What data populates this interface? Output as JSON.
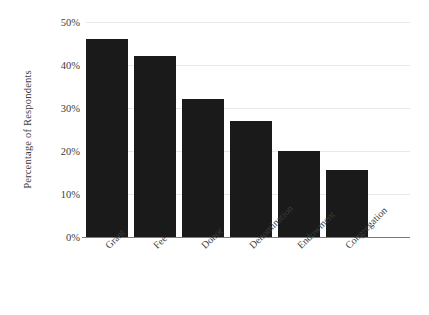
{
  "chart_data": {
    "type": "bar",
    "title": "",
    "xlabel": "",
    "ylabel": "Percentage of Respondents",
    "categories": [
      "Grant",
      "Fee",
      "Donor",
      "Denomination",
      "Endowment",
      "Congregation"
    ],
    "values": [
      46,
      42,
      32,
      27,
      20,
      15.5
    ],
    "ylim": [
      0,
      50
    ],
    "ytick_labels": [
      "0%",
      "10%",
      "20%",
      "30%",
      "40%",
      "50%"
    ],
    "ytick_values": [
      0,
      10,
      20,
      30,
      40,
      50
    ],
    "grid": true,
    "legend": null,
    "bar_color": "#1a1a1a",
    "background_color": "#ffffff",
    "gridline_color": "#e9e9e9",
    "axis_color": "#7a7a7a",
    "xtick_rotation": -45
  }
}
